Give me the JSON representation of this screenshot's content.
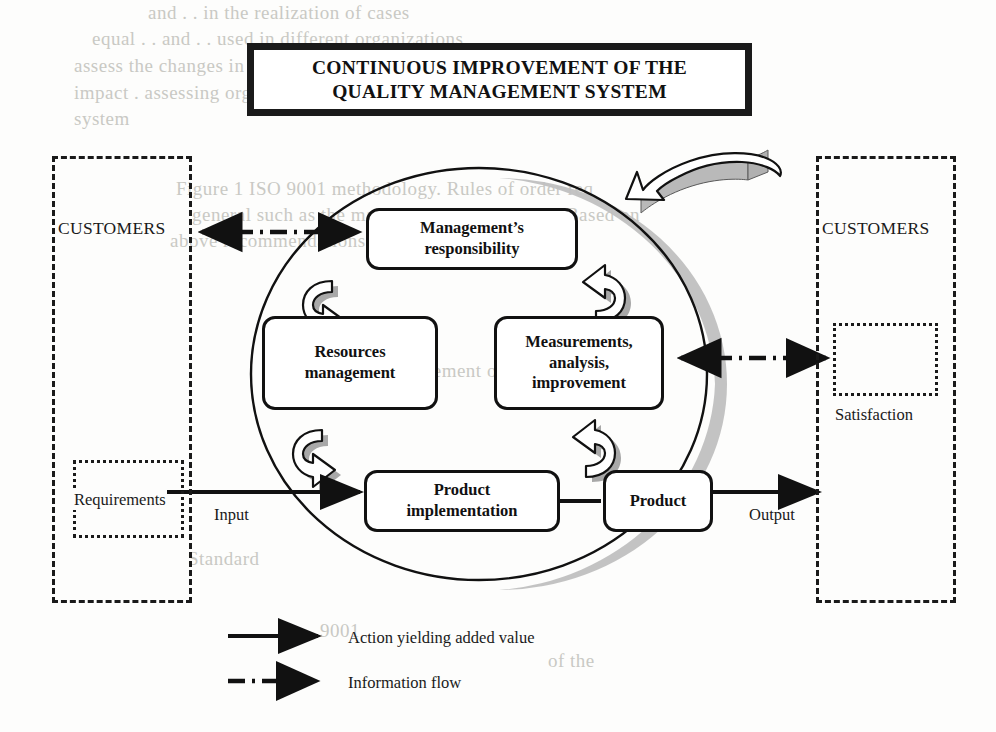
{
  "title": {
    "line1": "CONTINUOUS IMPROVEMENT OF THE",
    "line2": "QUALITY MANAGEMENT SYSTEM",
    "full": "CONTINUOUS IMPROVEMENT OF THE QUALITY MANAGEMENT SYSTEM"
  },
  "customers": {
    "left_label": "CUSTOMERS",
    "right_label": "CUSTOMERS",
    "requirements_label": "Requirements",
    "satisfaction_label": "Satisfaction"
  },
  "flow": {
    "input_label": "Input",
    "output_label": "Output"
  },
  "processes": [
    {
      "id": "management-responsibility",
      "line1": "Management’s",
      "line2": "responsibility",
      "line3": ""
    },
    {
      "id": "resources-management",
      "line1": "Resources",
      "line2": "management",
      "line3": ""
    },
    {
      "id": "measurements-analysis-improvement",
      "line1": "Measurements,",
      "line2": "analysis,",
      "line3": "improvement"
    },
    {
      "id": "product-implementation",
      "line1": "Product",
      "line2": "implementation",
      "line3": ""
    },
    {
      "id": "product",
      "line1": "Product",
      "line2": "",
      "line3": ""
    }
  ],
  "legend": [
    {
      "icon": "solid-arrow-icon",
      "label": "Action yielding added value"
    },
    {
      "icon": "dash-dot-arrow-icon",
      "label": "Information flow"
    }
  ],
  "colors": {
    "ink": "#111111",
    "shadow_gray": "#b9b9b9",
    "arrow_shadow_gray": "#9e9e9e",
    "background": "#fdfdfc",
    "bleed_text": "#c9c9c4"
  },
  "bleed_text": [
    {
      "text": "and    . . in the realization of cases",
      "x": 148,
      "y": 2
    },
    {
      "text": "equal    . . and    . . used in different organizations,",
      "x": 92,
      "y": 28
    },
    {
      "text": "assess the  changes  in  the  Standard  or  on-line  evidence  or",
      "x": 74,
      "y": 55
    },
    {
      "text": "impact    .   assessing   organizational   conformity   and",
      "x": 74,
      "y": 82
    },
    {
      "text": "system",
      "x": 74,
      "y": 108
    },
    {
      "text": "Figure 1  ISO 9001 methodology.  Rules  of  order  req",
      "x": 176,
      "y": 178
    },
    {
      "text": "general  such  as the  management  requirement.  Based on",
      "x": 192,
      "y": 204
    },
    {
      "text": "above recommendations shown on the",
      "x": 170,
      "y": 230
    },
    {
      "text": "Requirement  of  the  central",
      "x": 378,
      "y": 360
    },
    {
      "text": "Standard",
      "x": 188,
      "y": 548
    },
    {
      "text": "9001",
      "x": 320,
      "y": 620
    },
    {
      "text": "of the",
      "x": 548,
      "y": 650
    }
  ]
}
